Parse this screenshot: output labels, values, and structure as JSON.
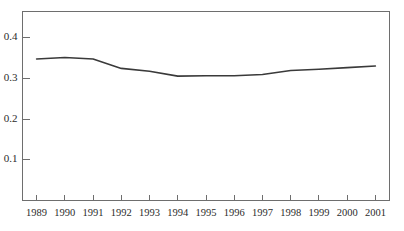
{
  "chart_data": {
    "type": "line",
    "title": "",
    "subtitle": "",
    "xlabel": "",
    "ylabel": "",
    "grid": false,
    "legend": false,
    "legend_position": "none",
    "line_color": "#3a3a3a",
    "axis_color": "#6e6e6e",
    "background_color": "#ffffff",
    "categories": [
      "1989",
      "1990",
      "1991",
      "1992",
      "1993",
      "1994",
      "1995",
      "1996",
      "1997",
      "1998",
      "1999",
      "2000",
      "2001"
    ],
    "x": [
      1989,
      1990,
      1991,
      1992,
      1993,
      1994,
      1995,
      1996,
      1997,
      1998,
      1999,
      2000,
      2001
    ],
    "values": [
      0.348,
      0.352,
      0.348,
      0.325,
      0.318,
      0.306,
      0.307,
      0.307,
      0.31,
      0.32,
      0.323,
      0.327,
      0.331
    ],
    "series": [
      {
        "name": "",
        "values": [
          0.348,
          0.352,
          0.348,
          0.325,
          0.318,
          0.306,
          0.307,
          0.307,
          0.31,
          0.32,
          0.323,
          0.327,
          0.331
        ]
      }
    ],
    "ylim": [
      0.0,
      0.465
    ],
    "xlim": [
      1988.5,
      2001.5
    ],
    "yticks": [
      0.1,
      0.2,
      0.3,
      0.4
    ],
    "ytick_labels": [
      "0.1",
      "0.2",
      "0.3",
      "0.4"
    ],
    "xticks": [
      1989,
      1990,
      1991,
      1992,
      1993,
      1994,
      1995,
      1996,
      1997,
      1998,
      1999,
      2000,
      2001
    ],
    "xtick_labels": [
      "1989",
      "1990",
      "1991",
      "1992",
      "1993",
      "1994",
      "1995",
      "1996",
      "1997",
      "1998",
      "1999",
      "2000",
      "2001"
    ],
    "annotations": []
  }
}
